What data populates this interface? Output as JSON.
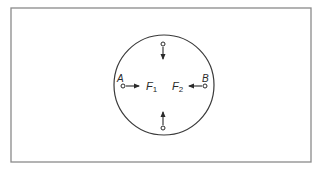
{
  "diagram": {
    "frame": {
      "x": 11,
      "y": 8,
      "width": 300,
      "height": 154,
      "stroke": "#8a8a8a"
    },
    "circle": {
      "cx": 164,
      "cy": 85,
      "r": 50,
      "stroke": "#3a3a3a"
    },
    "points": {
      "A": {
        "label": "A",
        "x": 123,
        "y": 86
      },
      "B": {
        "label": "B",
        "x": 205,
        "y": 86
      },
      "top": {
        "x": 163,
        "y": 44
      },
      "bottom": {
        "x": 163,
        "y": 128
      }
    },
    "forces": [
      {
        "label": "F",
        "subscript": "1",
        "direction": "right",
        "from": "A"
      },
      {
        "label": "F",
        "subscript": "2",
        "direction": "left",
        "from": "B"
      }
    ],
    "arrows": [
      {
        "from": "A",
        "direction": "right"
      },
      {
        "from": "B",
        "direction": "left"
      },
      {
        "from": "top",
        "direction": "down"
      },
      {
        "from": "bottom",
        "direction": "up"
      }
    ],
    "ink_color": "#2a2a2a"
  }
}
